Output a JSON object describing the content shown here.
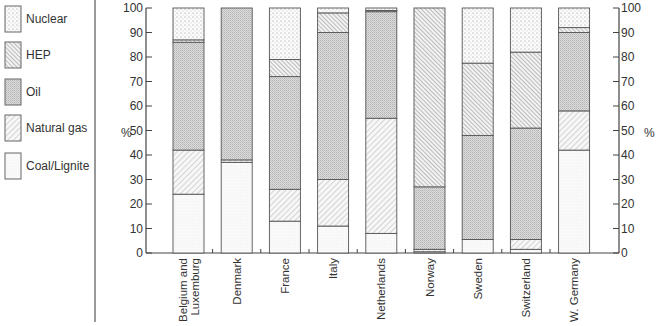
{
  "legend": {
    "items": [
      {
        "key": "nuclear",
        "label": "Nuclear",
        "pattern": "sparse-dots"
      },
      {
        "key": "hep",
        "label": "HEP",
        "pattern": "backslash-hatch"
      },
      {
        "key": "oil",
        "label": "Oil",
        "pattern": "fine-gray-check"
      },
      {
        "key": "gas",
        "label": "Natural gas",
        "pattern": "slash-hatch"
      },
      {
        "key": "coal",
        "label": "Coal/Lignite",
        "pattern": "light-stipple"
      }
    ]
  },
  "axes": {
    "left_label": "%",
    "right_label": "%",
    "ticks": [
      "0",
      "10",
      "20",
      "30",
      "40",
      "50",
      "60",
      "70",
      "80",
      "90",
      "100"
    ]
  },
  "chart_data": {
    "type": "bar",
    "stacked": true,
    "title": "",
    "xlabel": "",
    "ylabel": "%",
    "ylim": [
      0,
      100
    ],
    "grid": false,
    "legend_position": "left",
    "categories": [
      "Belgium and Luxemburg",
      "Denmark",
      "France",
      "Italy",
      "Netherlands",
      "Norway",
      "Sweden",
      "Switzerland",
      "W. Germany"
    ],
    "category_lines": [
      [
        "Belgium and",
        "Luxemburg"
      ],
      [
        "Denmark"
      ],
      [
        "France"
      ],
      [
        "Italy"
      ],
      [
        "Netherlands"
      ],
      [
        "Norway"
      ],
      [
        "Sweden"
      ],
      [
        "Switzerland"
      ],
      [
        "W. Germany"
      ]
    ],
    "series": [
      {
        "name": "Coal/Lignite",
        "key": "coal",
        "values": [
          24,
          37,
          13,
          11,
          8,
          0.5,
          5.5,
          1.5,
          42
        ]
      },
      {
        "name": "Natural gas",
        "key": "gas",
        "values": [
          18,
          1,
          13,
          19,
          47,
          1,
          0,
          4,
          16
        ]
      },
      {
        "name": "Oil",
        "key": "oil",
        "values": [
          44,
          62,
          46,
          60,
          43.5,
          25.5,
          42.5,
          45.5,
          32
        ]
      },
      {
        "name": "HEP",
        "key": "hep",
        "values": [
          1,
          0,
          7,
          8,
          0.5,
          73,
          29.5,
          31,
          2
        ]
      },
      {
        "name": "Nuclear",
        "key": "nuclear",
        "values": [
          13,
          0,
          21,
          2,
          1,
          0,
          22.5,
          18,
          8
        ]
      }
    ]
  }
}
